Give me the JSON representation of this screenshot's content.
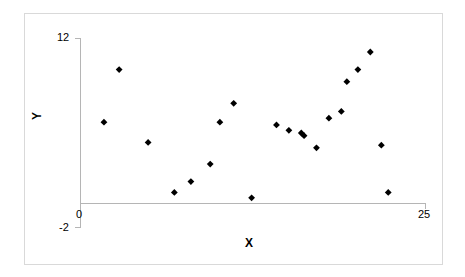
{
  "chart_data": {
    "type": "scatter",
    "title": "",
    "xlabel": "X",
    "ylabel": "Y",
    "xlim": [
      0,
      25
    ],
    "ylim": [
      -2,
      12
    ],
    "xticks": [
      "0",
      "25"
    ],
    "yticks": [
      "12",
      "-2"
    ],
    "grid": false,
    "legend": false,
    "marker": "diamond",
    "marker_color": "#000000",
    "series": [
      {
        "name": "",
        "points": [
          {
            "x": 1.7,
            "y": 5.8
          },
          {
            "x": 2.8,
            "y": 9.7
          },
          {
            "x": 4.9,
            "y": 4.3
          },
          {
            "x": 6.8,
            "y": 0.6
          },
          {
            "x": 8.0,
            "y": 1.4
          },
          {
            "x": 9.4,
            "y": 2.7
          },
          {
            "x": 10.1,
            "y": 5.8
          },
          {
            "x": 11.1,
            "y": 7.2
          },
          {
            "x": 12.4,
            "y": 0.2
          },
          {
            "x": 14.2,
            "y": 5.6
          },
          {
            "x": 15.1,
            "y": 5.2
          },
          {
            "x": 16.2,
            "y": 4.8
          },
          {
            "x": 17.1,
            "y": 3.9
          },
          {
            "x": 18.0,
            "y": 6.1
          },
          {
            "x": 18.9,
            "y": 6.6
          },
          {
            "x": 19.3,
            "y": 8.8
          },
          {
            "x": 20.1,
            "y": 9.7
          },
          {
            "x": 21.0,
            "y": 11.0
          },
          {
            "x": 21.8,
            "y": 4.1
          },
          {
            "x": 22.3,
            "y": 0.6
          },
          {
            "x": 16.0,
            "y": 5.0
          }
        ]
      }
    ]
  },
  "axes": {
    "x_axis_title": "X",
    "y_axis_title": "Y",
    "y_top_label": "12",
    "y_bottom_label": "-2",
    "x_left_label": "0",
    "x_right_label": "25"
  }
}
